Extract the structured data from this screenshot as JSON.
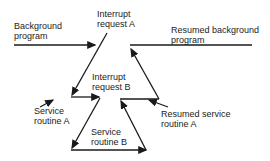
{
  "diagram": {
    "labels": {
      "background_program": [
        "Background",
        "program"
      ],
      "interrupt_request_a": [
        "Interrupt",
        "request A"
      ],
      "resumed_background": [
        "Resumed background",
        "program"
      ],
      "interrupt_request_b": [
        "Interrupt",
        "request B"
      ],
      "service_routine_a": [
        "Service",
        "routine A"
      ],
      "resumed_service_routine_a": [
        "Resumed service",
        "routine A"
      ],
      "service_routine_b": [
        "Service",
        "routine B"
      ]
    },
    "colors": {
      "line": "#1a1a1a",
      "text": "#222222",
      "background": "#ffffff"
    }
  }
}
